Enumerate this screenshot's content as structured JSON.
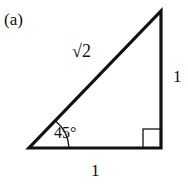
{
  "figure": {
    "panel_label": "(a)",
    "hypotenuse_label": "√2",
    "vertical_leg_label": "1",
    "horizontal_leg_label": "1",
    "angle_label": "45°",
    "right_angle_marker": "right-angle-square",
    "stroke_color": "#111111",
    "background_color": "#ffffff"
  }
}
